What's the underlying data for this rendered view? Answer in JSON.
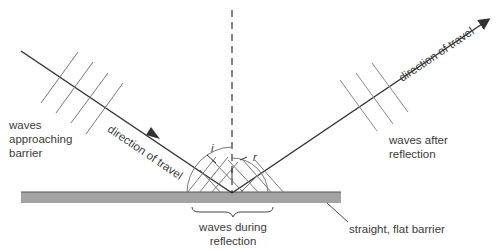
{
  "labels": {
    "incident_direction": "direction of travel",
    "reflected_direction": "direction of travel",
    "waves_approaching_line1": "waves",
    "waves_approaching_line2": "approaching",
    "waves_approaching_line3": "barrier",
    "waves_after_line1": "waves after",
    "waves_after_line2": "reflection",
    "waves_during_line1": "waves during",
    "waves_during_line2": "reflection",
    "barrier": "straight, flat barrier",
    "angle_incidence": "i",
    "angle_reflection": "r"
  },
  "colors": {
    "ray": "#333333",
    "wavefront": "#777777",
    "barrier_fill": "#a0a0a0",
    "barrier_edge": "#555555",
    "normal": "#333333"
  }
}
